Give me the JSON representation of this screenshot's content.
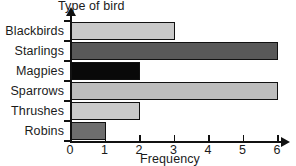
{
  "chart_data": {
    "type": "bar",
    "orientation": "horizontal",
    "title": "",
    "xlabel": "Frequency",
    "ylabel": "Type of bird",
    "categories": [
      "Blackbirds",
      "Starlings",
      "Magpies",
      "Sparrows",
      "Thrushes",
      "Robins"
    ],
    "values": [
      3,
      6,
      2,
      6,
      2,
      1
    ],
    "bar_colors": [
      "#c9c9c9",
      "#595959",
      "#090909",
      "#bdbdbd",
      "#cacaca",
      "#6e6e6e"
    ],
    "xlim": [
      0,
      6
    ],
    "xticks": [
      0,
      1,
      2,
      3,
      4,
      5,
      6
    ],
    "xtick_labels": [
      "0",
      "1",
      "2",
      "3",
      "4",
      "5",
      "6"
    ],
    "grid": false,
    "legend": false,
    "axis_color": "#111111"
  },
  "axes": {
    "y_axis_title": "Type of bird",
    "x_axis_title": "Frequency"
  }
}
